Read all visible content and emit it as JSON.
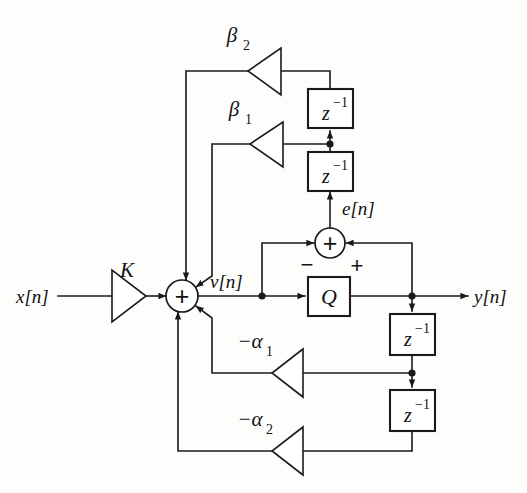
{
  "diagram": {
    "type": "signal-flow-block-diagram",
    "colors": {
      "line": "#1a1a1a",
      "background": "#fdfdfb",
      "block_fill": "#ffffff"
    },
    "signals": {
      "input": "x[n]",
      "output": "y[n]",
      "internal_v": "v[n]",
      "error": "e[n]"
    },
    "gains": {
      "k": "K",
      "beta1_base": "β",
      "beta1_sub": "1",
      "beta2_base": "β",
      "beta2_sub": "2",
      "alpha1_base": "−α",
      "alpha1_sub": "1",
      "alpha2_base": "−α",
      "alpha2_sub": "2"
    },
    "blocks": {
      "quantizer": "Q",
      "delay_base": "z",
      "delay_exp": "−1"
    },
    "delays": [
      {
        "id": "delay-top-upper",
        "label": "z",
        "exponent": "−1"
      },
      {
        "id": "delay-top-lower",
        "label": "z",
        "exponent": "−1"
      },
      {
        "id": "delay-bottom-upper",
        "label": "z",
        "exponent": "−1"
      },
      {
        "id": "delay-bottom-lower",
        "label": "z",
        "exponent": "−1"
      }
    ],
    "adders": {
      "main_sum": "+",
      "error_sum": "+",
      "error_sum_minus_port": "−",
      "error_sum_plus_port": "+"
    }
  }
}
